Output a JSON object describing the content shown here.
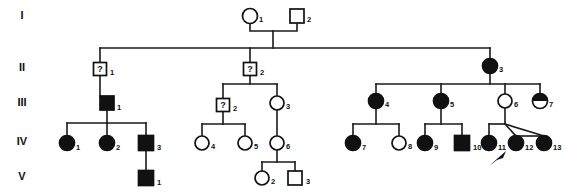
{
  "figure": {
    "kind": "pedigree-chart",
    "width": 566,
    "height": 196,
    "background_color": "#ffffff",
    "line_color": "#1a1a1a",
    "filled_color": "#111111",
    "open_color": "#ffffff"
  },
  "generation_labels": [
    {
      "name": "generation-label-1",
      "text": "I",
      "x": 22,
      "y": 19
    },
    {
      "name": "generation-label-2",
      "text": "II",
      "x": 22,
      "y": 71
    },
    {
      "name": "generation-label-3",
      "text": "III",
      "x": 22,
      "y": 106
    },
    {
      "name": "generation-label-4",
      "text": "IV",
      "x": 22,
      "y": 145
    },
    {
      "name": "generation-label-5",
      "text": "V",
      "x": 22,
      "y": 180
    }
  ],
  "individuals": [
    {
      "id": "I-1",
      "generation": "I",
      "number": "1",
      "sex": "female",
      "shape": "circle",
      "status": "unaffected",
      "fill": "open",
      "cx": 250,
      "cy": 16,
      "r": 7.5,
      "label_x": 259,
      "label_y": 22
    },
    {
      "id": "I-2",
      "generation": "I",
      "number": "2",
      "sex": "male",
      "shape": "square",
      "status": "unaffected",
      "fill": "open",
      "cx": 297,
      "cy": 16,
      "r": 7.0,
      "label_x": 307,
      "label_y": 22
    },
    {
      "id": "II-1",
      "generation": "II",
      "number": "1",
      "sex": "male",
      "shape": "square",
      "status": "unknown",
      "fill": "question",
      "cx": 100,
      "cy": 69,
      "r": 6.5,
      "label_x": 110,
      "label_y": 75
    },
    {
      "id": "II-2",
      "generation": "II",
      "number": "2",
      "sex": "male",
      "shape": "square",
      "status": "unknown",
      "fill": "question",
      "cx": 250,
      "cy": 69,
      "r": 6.5,
      "label_x": 260,
      "label_y": 75
    },
    {
      "id": "II-3",
      "generation": "II",
      "number": "3",
      "sex": "female",
      "shape": "circle",
      "status": "affected",
      "fill": "filled",
      "cx": 490,
      "cy": 66,
      "r": 7.5,
      "label_x": 499,
      "label_y": 72
    },
    {
      "id": "III-1",
      "generation": "III",
      "number": "1",
      "sex": "male",
      "shape": "square",
      "status": "affected",
      "fill": "filled",
      "cx": 107,
      "cy": 103,
      "r": 7.0,
      "label_x": 117,
      "label_y": 110
    },
    {
      "id": "III-2",
      "generation": "III",
      "number": "2",
      "sex": "male",
      "shape": "square",
      "status": "unknown",
      "fill": "question",
      "cx": 223,
      "cy": 105,
      "r": 6.5,
      "label_x": 233,
      "label_y": 111
    },
    {
      "id": "III-3",
      "generation": "III",
      "number": "3",
      "sex": "female",
      "shape": "circle",
      "status": "unaffected",
      "fill": "open",
      "cx": 277,
      "cy": 103,
      "r": 7.0,
      "label_x": 286,
      "label_y": 109
    },
    {
      "id": "III-4",
      "generation": "III",
      "number": "4",
      "sex": "female",
      "shape": "circle",
      "status": "affected",
      "fill": "filled",
      "cx": 376,
      "cy": 101,
      "r": 7.5,
      "label_x": 385,
      "label_y": 107
    },
    {
      "id": "III-5",
      "generation": "III",
      "number": "5",
      "sex": "female",
      "shape": "circle",
      "status": "affected",
      "fill": "filled",
      "cx": 441,
      "cy": 101,
      "r": 7.5,
      "label_x": 450,
      "label_y": 107
    },
    {
      "id": "III-6",
      "generation": "III",
      "number": "6",
      "sex": "female",
      "shape": "circle",
      "status": "unaffected",
      "fill": "open",
      "cx": 505,
      "cy": 101,
      "r": 7.0,
      "label_x": 514,
      "label_y": 107
    },
    {
      "id": "III-7",
      "generation": "III",
      "number": "7",
      "sex": "female",
      "shape": "circle",
      "status": "carrier",
      "fill": "half-top",
      "cx": 540,
      "cy": 101,
      "r": 7.5,
      "label_x": 549,
      "label_y": 107
    },
    {
      "id": "IV-1",
      "generation": "IV",
      "number": "1",
      "sex": "female",
      "shape": "circle",
      "status": "affected",
      "fill": "filled",
      "cx": 67,
      "cy": 143,
      "r": 7.5,
      "label_x": 76,
      "label_y": 150
    },
    {
      "id": "IV-2",
      "generation": "IV",
      "number": "2",
      "sex": "female",
      "shape": "circle",
      "status": "affected",
      "fill": "filled",
      "cx": 107,
      "cy": 143,
      "r": 7.5,
      "label_x": 116,
      "label_y": 150
    },
    {
      "id": "IV-3",
      "generation": "IV",
      "number": "3",
      "sex": "male",
      "shape": "square",
      "status": "affected",
      "fill": "filled",
      "cx": 146,
      "cy": 143,
      "r": 7.5,
      "label_x": 157,
      "label_y": 150
    },
    {
      "id": "IV-4",
      "generation": "IV",
      "number": "4",
      "sex": "female",
      "shape": "circle",
      "status": "unaffected",
      "fill": "open",
      "cx": 202,
      "cy": 143,
      "r": 7.0,
      "label_x": 211,
      "label_y": 149
    },
    {
      "id": "IV-5",
      "generation": "IV",
      "number": "5",
      "sex": "female",
      "shape": "circle",
      "status": "unaffected",
      "fill": "open",
      "cx": 245,
      "cy": 143,
      "r": 7.0,
      "label_x": 254,
      "label_y": 149
    },
    {
      "id": "IV-6",
      "generation": "IV",
      "number": "6",
      "sex": "female",
      "shape": "circle",
      "status": "unaffected",
      "fill": "open",
      "cx": 277,
      "cy": 143,
      "r": 7.0,
      "label_x": 286,
      "label_y": 149
    },
    {
      "id": "IV-7",
      "generation": "IV",
      "number": "7",
      "sex": "female",
      "shape": "circle",
      "status": "affected",
      "fill": "filled",
      "cx": 353,
      "cy": 143,
      "r": 7.5,
      "label_x": 362,
      "label_y": 150
    },
    {
      "id": "IV-8",
      "generation": "IV",
      "number": "8",
      "sex": "female",
      "shape": "circle",
      "status": "unaffected",
      "fill": "open",
      "cx": 399,
      "cy": 143,
      "r": 7.0,
      "label_x": 408,
      "label_y": 149
    },
    {
      "id": "IV-9",
      "generation": "IV",
      "number": "9",
      "sex": "female",
      "shape": "circle",
      "status": "affected",
      "fill": "filled",
      "cx": 425,
      "cy": 143,
      "r": 7.5,
      "label_x": 434,
      "label_y": 150
    },
    {
      "id": "IV-10",
      "generation": "IV",
      "number": "10",
      "sex": "male",
      "shape": "square",
      "status": "affected",
      "fill": "filled",
      "cx": 462,
      "cy": 143,
      "r": 7.5,
      "label_x": 473,
      "label_y": 150
    },
    {
      "id": "IV-11",
      "generation": "IV",
      "number": "11",
      "sex": "female",
      "shape": "circle",
      "status": "affected",
      "fill": "filled",
      "cx": 489,
      "cy": 143,
      "r": 7.5,
      "label_x": 498,
      "label_y": 150
    },
    {
      "id": "IV-12",
      "generation": "IV",
      "number": "12",
      "sex": "female",
      "shape": "circle",
      "status": "affected",
      "fill": "filled",
      "cx": 516,
      "cy": 143,
      "r": 7.5,
      "label_x": 525,
      "label_y": 150
    },
    {
      "id": "IV-13",
      "generation": "IV",
      "number": "13",
      "sex": "female",
      "shape": "circle",
      "status": "affected",
      "fill": "filled",
      "cx": 544,
      "cy": 143,
      "r": 7.5,
      "label_x": 553,
      "label_y": 150
    },
    {
      "id": "V-1",
      "generation": "V",
      "number": "1",
      "sex": "male",
      "shape": "square",
      "status": "affected",
      "fill": "filled",
      "cx": 146,
      "cy": 178,
      "r": 7.5,
      "label_x": 157,
      "label_y": 185
    },
    {
      "id": "V-2",
      "generation": "V",
      "number": "2",
      "sex": "female",
      "shape": "circle",
      "status": "unaffected",
      "fill": "open",
      "cx": 262,
      "cy": 178,
      "r": 7.0,
      "label_x": 271,
      "label_y": 184
    },
    {
      "id": "V-3",
      "generation": "V",
      "number": "3",
      "sex": "male",
      "shape": "square",
      "status": "unaffected",
      "fill": "open",
      "cx": 295,
      "cy": 178,
      "r": 7.0,
      "label_x": 306,
      "label_y": 184
    }
  ],
  "connectors": {
    "mating_lines": [
      {
        "name": "mating-I1-I2",
        "d": "M 250 24 L 250 31 L 297 31 L 297 24"
      },
      {
        "name": "descent-I-couple",
        "d": "M 273 31 L 273 48"
      }
    ],
    "sibship_lines": [
      {
        "name": "sibship-generation-II",
        "d": "M 100 48 L 490 48"
      },
      {
        "name": "drop-II-1",
        "d": "M 100 48 L 100 62"
      },
      {
        "name": "drop-II-2",
        "d": "M 250 48 L 250 62"
      },
      {
        "name": "drop-II-3",
        "d": "M 490 48 L 490 58"
      },
      {
        "name": "descent-II1-to-III1",
        "d": "M 100 76 L 100 96"
      },
      {
        "name": "descent-II2",
        "d": "M 250 76 L 250 84"
      },
      {
        "name": "sibship-III-mid",
        "d": "M 223 84 L 277 84"
      },
      {
        "name": "drop-III-2",
        "d": "M 223 84 L 223 98"
      },
      {
        "name": "drop-III-3",
        "d": "M 277 84 L 277 96"
      },
      {
        "name": "descent-II3",
        "d": "M 490 74 L 490 84"
      },
      {
        "name": "sibship-III-right",
        "d": "M 376 84 L 540 84"
      },
      {
        "name": "drop-III-4",
        "d": "M 376 84 L 376 93"
      },
      {
        "name": "drop-III-5",
        "d": "M 441 84 L 441 93"
      },
      {
        "name": "drop-III-6",
        "d": "M 505 84 L 505 94"
      },
      {
        "name": "drop-III-7",
        "d": "M 540 84 L 540 93"
      },
      {
        "name": "descent-III1",
        "d": "M 107 110 L 107 123"
      },
      {
        "name": "sibship-IV-left",
        "d": "M 67 123 L 146 123"
      },
      {
        "name": "drop-IV-1",
        "d": "M 67 123 L 67 135"
      },
      {
        "name": "drop-IV-2",
        "d": "M 107 123 L 107 135"
      },
      {
        "name": "drop-IV-3",
        "d": "M 146 123 L 146 135"
      },
      {
        "name": "descent-III2",
        "d": "M 223 112 L 223 124"
      },
      {
        "name": "sibship-IV-mid",
        "d": "M 202 124 L 245 124"
      },
      {
        "name": "drop-IV-4",
        "d": "M 202 124 L 202 136"
      },
      {
        "name": "drop-IV-5",
        "d": "M 245 124 L 245 136"
      },
      {
        "name": "descent-III3-to-IV6",
        "d": "M 277 110 L 277 136"
      },
      {
        "name": "descent-III4",
        "d": "M 376 109 L 376 124"
      },
      {
        "name": "sibship-IV-r1",
        "d": "M 353 124 L 399 124"
      },
      {
        "name": "drop-IV-7",
        "d": "M 353 124 L 353 135"
      },
      {
        "name": "drop-IV-8",
        "d": "M 399 124 L 399 136"
      },
      {
        "name": "descent-III5",
        "d": "M 441 109 L 441 124"
      },
      {
        "name": "sibship-IV-r2",
        "d": "M 425 124 L 462 124"
      },
      {
        "name": "drop-IV-9",
        "d": "M 425 124 L 425 135"
      },
      {
        "name": "drop-IV-10",
        "d": "M 462 124 L 462 135"
      },
      {
        "name": "descent-III6",
        "d": "M 505 108 L 505 124"
      },
      {
        "name": "sibship-IV-r3",
        "d": "M 489 124 L 505 124"
      },
      {
        "name": "drop-IV-11",
        "d": "M 489 124 L 489 135"
      },
      {
        "name": "descent-IV3-to-V1",
        "d": "M 146 151 L 146 170"
      },
      {
        "name": "descent-IV6",
        "d": "M 277 150 L 277 162"
      },
      {
        "name": "sibship-V-mid",
        "d": "M 262 162 L 295 162"
      },
      {
        "name": "drop-V-2",
        "d": "M 262 162 L 262 171"
      },
      {
        "name": "drop-V-3",
        "d": "M 295 162 L 295 171"
      }
    ],
    "twin_lines": [
      {
        "name": "twin-line-IV12",
        "d": "M 505 124 L 516 136"
      },
      {
        "name": "twin-line-IV13",
        "d": "M 505 124 L 544 136"
      },
      {
        "name": "twin-crossbar",
        "d": "M 516 136 L 544 136"
      }
    ]
  },
  "proband": {
    "name": "proband-arrow",
    "points_to": "IV-12",
    "path": "M 489 166 L 506 151 L 503 158 L 497 160 Z"
  }
}
